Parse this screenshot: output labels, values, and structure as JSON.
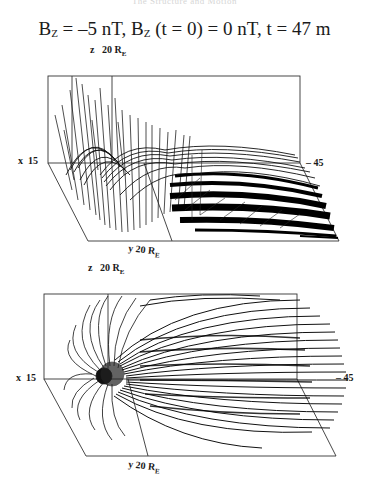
{
  "header_faint": "The Structure and Motion",
  "title": {
    "b_label": "B",
    "b_sub": "Z",
    "part1": " = –5 nT, ",
    "b2_label": "B",
    "b2_sub": "Z",
    "part2": " (t = 0) = 0 nT,  t = 47 m"
  },
  "panels": [
    {
      "id": "top",
      "z_axis_label": "z",
      "z_axis_value": "20 R",
      "z_axis_sub": "E",
      "x_axis_label": "x",
      "x_axis_value": "15",
      "x_axis_far_value": "– 45",
      "y_axis_label": "y",
      "y_axis_value": "20 R",
      "y_axis_sub": "E"
    },
    {
      "id": "bottom",
      "z_axis_label": "z",
      "z_axis_value": "20 R",
      "z_axis_sub": "E",
      "x_axis_label": "x",
      "x_axis_value": "15",
      "x_axis_far_value": "– 45",
      "y_axis_label": "y",
      "y_axis_value": "20 R",
      "y_axis_sub": "E"
    }
  ],
  "colors": {
    "ink": "#111111",
    "frame": "#333333"
  }
}
